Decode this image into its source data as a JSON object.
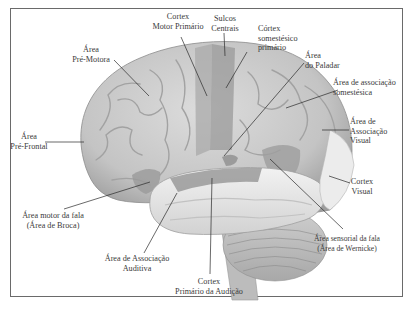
{
  "figure": {
    "title": "",
    "colors": {
      "brain_base": "#c9c9c9",
      "highlighted_region": "#9a9a9a",
      "temporal_lobe": "#e6e6e6",
      "cerebellum": "#bdbdbd",
      "leader_line": "#2a2a2a",
      "frame": "#6a6a6a"
    },
    "labels": [
      {
        "id": "cortex-motor-primario",
        "line1": "Cortex",
        "line2": "Motor Primário"
      },
      {
        "id": "sulcos-centrais",
        "line1": "Sulcos",
        "line2": "Centrais"
      },
      {
        "id": "cortex-somestesico-primario",
        "line1": "Córtex",
        "line2": "somestésico",
        "line3": "primário"
      },
      {
        "id": "area-pre-motora",
        "line1": "Área",
        "line2": "Pré-Motora"
      },
      {
        "id": "area-do-paladar",
        "line1": "Área",
        "line2": "do Paladar"
      },
      {
        "id": "area-associacao-somestesica",
        "line1": "Área de associação",
        "line2": "somestésica"
      },
      {
        "id": "area-pre-frontal",
        "line1": "Área",
        "line2": "Pré-Frontal"
      },
      {
        "id": "area-associacao-visual",
        "line1": "Área de",
        "line2": "Associação",
        "line3": "Visual"
      },
      {
        "id": "cortex-visual",
        "line1": "Cortex",
        "line2": "Visual"
      },
      {
        "id": "area-motor-fala",
        "line1": "Área motor da fala",
        "line2": "(Área de Broca)"
      },
      {
        "id": "area-sensorial-fala",
        "line1": "Área sensorial da fala",
        "line2": "(Área de Wernicke)"
      },
      {
        "id": "area-associacao-auditiva",
        "line1": "Área de Associação",
        "line2": "Auditiva"
      },
      {
        "id": "cortex-primario-audicao",
        "line1": "Cortex",
        "line2": "Primário da Audição"
      }
    ]
  }
}
